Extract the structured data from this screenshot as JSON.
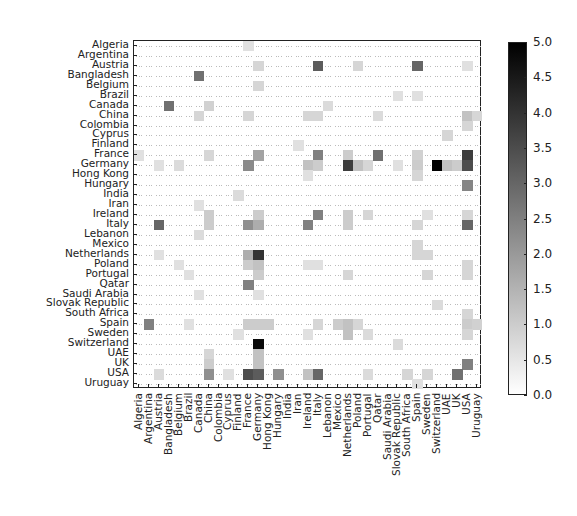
{
  "chart_data": {
    "type": "heatmap",
    "title": "",
    "xlabel": "",
    "ylabel": "",
    "labels": [
      "Algeria",
      "Argentina",
      "Austria",
      "Bangladesh",
      "Belgium",
      "Brazil",
      "Canada",
      "China",
      "Colombia",
      "Cyprus",
      "Finland",
      "France",
      "Germany",
      "Hong Kong",
      "Hungary",
      "India",
      "Iran",
      "Ireland",
      "Italy",
      "Lebanon",
      "Mexico",
      "Netherlands",
      "Poland",
      "Portugal",
      "Qatar",
      "Saudi Arabia",
      "Slovak Republic",
      "South Africa",
      "Spain",
      "Sweden",
      "Switzerland",
      "UAE",
      "UK",
      "USA",
      "Uruguay"
    ],
    "colorbar": {
      "min": 0.0,
      "max": 5.0,
      "ticks": [
        "0.0",
        "0.5",
        "1.0",
        "1.5",
        "2.0",
        "2.5",
        "3.0",
        "3.5",
        "4.0",
        "4.5",
        "5.0"
      ],
      "colormap": "Greys"
    },
    "grid": true,
    "cells": [
      [
        0,
        11,
        0.6
      ],
      [
        2,
        12,
        0.8
      ],
      [
        2,
        18,
        3.2
      ],
      [
        2,
        22,
        0.8
      ],
      [
        2,
        28,
        3.0
      ],
      [
        2,
        33,
        0.6
      ],
      [
        3,
        6,
        2.8
      ],
      [
        4,
        12,
        0.8
      ],
      [
        5,
        26,
        0.6
      ],
      [
        5,
        28,
        0.6
      ],
      [
        6,
        3,
        2.8
      ],
      [
        6,
        7,
        0.9
      ],
      [
        6,
        19,
        0.7
      ],
      [
        7,
        6,
        0.8
      ],
      [
        7,
        11,
        0.8
      ],
      [
        7,
        17,
        0.8
      ],
      [
        7,
        18,
        0.8
      ],
      [
        7,
        24,
        0.7
      ],
      [
        7,
        33,
        1.2
      ],
      [
        7,
        34,
        0.8
      ],
      [
        8,
        33,
        0.8
      ],
      [
        9,
        31,
        0.8
      ],
      [
        10,
        16,
        0.6
      ],
      [
        11,
        0,
        0.6
      ],
      [
        11,
        7,
        0.8
      ],
      [
        11,
        12,
        1.8
      ],
      [
        11,
        18,
        2.5
      ],
      [
        11,
        21,
        1.0
      ],
      [
        11,
        24,
        2.8
      ],
      [
        11,
        28,
        0.9
      ],
      [
        11,
        33,
        3.8
      ],
      [
        12,
        2,
        0.6
      ],
      [
        12,
        4,
        0.7
      ],
      [
        12,
        11,
        2.3
      ],
      [
        12,
        17,
        1.2
      ],
      [
        12,
        18,
        1.0
      ],
      [
        12,
        21,
        3.8
      ],
      [
        12,
        22,
        1.2
      ],
      [
        12,
        23,
        0.8
      ],
      [
        12,
        26,
        0.6
      ],
      [
        12,
        28,
        1.0
      ],
      [
        12,
        30,
        5.0
      ],
      [
        12,
        31,
        1.2
      ],
      [
        12,
        32,
        1.0
      ],
      [
        12,
        33,
        3.5
      ],
      [
        13,
        17,
        0.6
      ],
      [
        13,
        28,
        0.8
      ],
      [
        14,
        33,
        2.4
      ],
      [
        15,
        10,
        0.7
      ],
      [
        16,
        6,
        0.6
      ],
      [
        17,
        7,
        1.0
      ],
      [
        17,
        12,
        1.0
      ],
      [
        17,
        18,
        2.5
      ],
      [
        17,
        21,
        1.0
      ],
      [
        17,
        23,
        0.8
      ],
      [
        17,
        29,
        0.6
      ],
      [
        17,
        33,
        0.8
      ],
      [
        18,
        2,
        3.0
      ],
      [
        18,
        7,
        1.0
      ],
      [
        18,
        11,
        2.2
      ],
      [
        18,
        12,
        1.6
      ],
      [
        18,
        17,
        2.5
      ],
      [
        18,
        21,
        1.0
      ],
      [
        18,
        28,
        0.8
      ],
      [
        18,
        33,
        3.0
      ],
      [
        19,
        6,
        0.7
      ],
      [
        20,
        28,
        0.8
      ],
      [
        21,
        2,
        0.6
      ],
      [
        21,
        11,
        1.6
      ],
      [
        21,
        12,
        4.0
      ],
      [
        21,
        28,
        0.8
      ],
      [
        21,
        29,
        0.8
      ],
      [
        22,
        4,
        0.6
      ],
      [
        22,
        11,
        1.0
      ],
      [
        22,
        12,
        1.2
      ],
      [
        22,
        17,
        0.6
      ],
      [
        22,
        18,
        0.6
      ],
      [
        22,
        33,
        0.8
      ],
      [
        23,
        5,
        0.6
      ],
      [
        23,
        12,
        1.0
      ],
      [
        23,
        21,
        0.8
      ],
      [
        23,
        29,
        0.8
      ],
      [
        23,
        33,
        0.8
      ],
      [
        24,
        11,
        2.5
      ],
      [
        25,
        6,
        0.6
      ],
      [
        25,
        12,
        0.6
      ],
      [
        26,
        30,
        0.7
      ],
      [
        27,
        33,
        0.8
      ],
      [
        28,
        1,
        2.5
      ],
      [
        28,
        5,
        0.6
      ],
      [
        28,
        11,
        1.0
      ],
      [
        28,
        12,
        1.0
      ],
      [
        28,
        13,
        1.0
      ],
      [
        28,
        18,
        0.8
      ],
      [
        28,
        20,
        1.0
      ],
      [
        28,
        21,
        1.2
      ],
      [
        28,
        22,
        0.8
      ],
      [
        28,
        33,
        1.0
      ],
      [
        28,
        34,
        0.9
      ],
      [
        29,
        10,
        0.6
      ],
      [
        29,
        17,
        0.6
      ],
      [
        29,
        21,
        1.2
      ],
      [
        29,
        23,
        0.7
      ],
      [
        29,
        33,
        0.8
      ],
      [
        30,
        12,
        4.8
      ],
      [
        30,
        26,
        0.7
      ],
      [
        31,
        7,
        0.8
      ],
      [
        31,
        12,
        1.2
      ],
      [
        32,
        7,
        1.0
      ],
      [
        32,
        12,
        1.2
      ],
      [
        32,
        33,
        2.5
      ],
      [
        33,
        2,
        0.7
      ],
      [
        33,
        7,
        2.2
      ],
      [
        33,
        9,
        0.6
      ],
      [
        33,
        11,
        3.5
      ],
      [
        33,
        12,
        3.2
      ],
      [
        33,
        14,
        2.2
      ],
      [
        33,
        17,
        1.2
      ],
      [
        33,
        18,
        3.0
      ],
      [
        33,
        23,
        0.7
      ],
      [
        33,
        27,
        0.8
      ],
      [
        33,
        29,
        0.8
      ],
      [
        33,
        32,
        2.8
      ],
      [
        34,
        28,
        0.6
      ]
    ]
  }
}
